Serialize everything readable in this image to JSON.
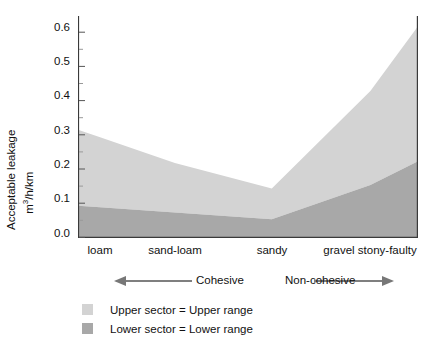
{
  "chart_data": {
    "type": "area",
    "title": "",
    "subtitle": "",
    "xlabel": "",
    "ylabel": "Acceptable leakage m3/h/km",
    "ylabel_line1": "Acceptable leakage",
    "ylabel_line2_prefix": "m",
    "ylabel_line2_sup": "3",
    "ylabel_line2_suffix": "/h/km",
    "categories": [
      "loam",
      "sand-loam",
      "sandy",
      "gravel stony-faulty"
    ],
    "category_x_fraction": [
      0.065,
      0.285,
      0.57,
      0.86
    ],
    "x_axis_extends_past_last_category": true,
    "ylim": [
      0.0,
      0.65
    ],
    "yticks": [
      0.0,
      0.1,
      0.2,
      0.3,
      0.4,
      0.5,
      0.6
    ],
    "ytick_labels": [
      "0.0",
      "0.1",
      "0.2",
      "0.3",
      "0.4",
      "0.5",
      "0.6"
    ],
    "yticks_minor": [
      0.05,
      0.15,
      0.25,
      0.35,
      0.45,
      0.55,
      0.65
    ],
    "grid": false,
    "legend_position": "below-plot-left",
    "series": [
      {
        "name": "Lower sector = Lower range",
        "color": "#a8a8a8",
        "stack_order": "bottom",
        "values": [
          0.09,
          0.075,
          0.055,
          0.155
        ],
        "value_at_right_edge": 0.225
      },
      {
        "name": "Upper sector = Upper range",
        "color": "#d3d3d3",
        "stack_order": "top",
        "values": [
          0.295,
          0.22,
          0.145,
          0.43
        ],
        "value_at_right_edge": 0.62
      }
    ],
    "annotations": [
      {
        "text": "Cohesive",
        "arrow": "left",
        "span": "loam to sandy"
      },
      {
        "text": "Non-cohesive",
        "arrow": "right",
        "span": "sandy to gravel stony-faulty"
      }
    ]
  },
  "axis": {
    "y_label_line1": "Acceptable leakage",
    "y_label_line2_prefix": "m",
    "y_label_line2_sup": "3",
    "y_label_line2_suffix": "/h/km",
    "y_tick_labels": [
      "0.6",
      "0.5",
      "0.4",
      "0.3",
      "0.2",
      "0.1",
      "0.0"
    ],
    "x_tick_labels": [
      "loam",
      "sand-loam",
      "sandy",
      "gravel stony-faulty"
    ]
  },
  "direction": {
    "cohesive_label": "Cohesive",
    "noncohesive_label": "Non-cohesive"
  },
  "legend": {
    "items": [
      {
        "label": "Upper sector = Upper range",
        "color": "#d3d3d3"
      },
      {
        "label": "Lower sector = Lower range",
        "color": "#a8a8a8"
      }
    ]
  },
  "colors": {
    "upper_band": "#d3d3d3",
    "lower_band": "#a8a8a8",
    "axis": "#3a3a3a",
    "text": "#111111",
    "background": "#ffffff"
  }
}
